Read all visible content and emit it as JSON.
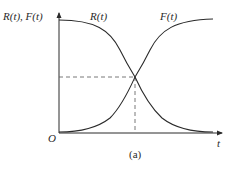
{
  "figure": {
    "y_axis_label": "R(t), F(t)",
    "x_axis_label": "t",
    "origin_label": "O",
    "caption": "(a)",
    "curves": [
      {
        "name": "R(t)",
        "label": "R(t)",
        "description": "reliability, decreasing S-curve from high to zero"
      },
      {
        "name": "F(t)",
        "label": "F(t)",
        "description": "failure probability, increasing S-curve from zero to high"
      }
    ],
    "crossing_point": {
      "dashed_guides": true,
      "level": "0.5"
    }
  },
  "colors": {
    "line": "#2a2a2a",
    "background": "#ffffff"
  }
}
